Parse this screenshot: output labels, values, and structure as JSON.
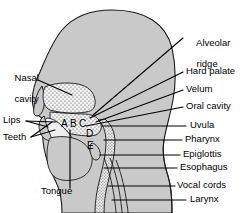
{
  "figure": {
    "background_color": "#ffffff",
    "head_fill_color": "#c9c9c9",
    "cavity_fill_color": "#f2f2f2",
    "outline_color": "#1a1a1a",
    "leader_line_color": "#000000",
    "text_color": "#000000"
  },
  "labels_left": [
    {
      "id": "nasal-cavity",
      "text_line1": "Nasal",
      "text_line2": "cavity",
      "x": 4,
      "y": 68
    },
    {
      "id": "lips",
      "text": "Lips",
      "x": 3,
      "y": 119
    },
    {
      "id": "teeth",
      "text": "Teeth",
      "x": 3,
      "y": 136
    },
    {
      "id": "tongue",
      "text": "Tongue",
      "x": 41,
      "y": 190
    }
  ],
  "labels_right": [
    {
      "id": "alveolar-ridge",
      "text_line1": "Alveolar",
      "text_line2": "ridge",
      "x": 186,
      "y": 33
    },
    {
      "id": "hard-palate",
      "text": "Hard palate",
      "x": 186,
      "y": 68
    },
    {
      "id": "velum",
      "text": "Velum",
      "x": 186,
      "y": 87
    },
    {
      "id": "oral-cavity",
      "text": "Oral cavity",
      "x": 186,
      "y": 104
    },
    {
      "id": "uvula",
      "text": "Uvula",
      "x": 190,
      "y": 123
    },
    {
      "id": "pharynx",
      "text": "Pharynx",
      "x": 185,
      "y": 137
    },
    {
      "id": "epiglottis",
      "text": "Epiglottis",
      "x": 183,
      "y": 152
    },
    {
      "id": "esophagus",
      "text": "Esophagus",
      "x": 180,
      "y": 165
    },
    {
      "id": "vocal-cords",
      "text": "Vocal cords",
      "x": 178,
      "y": 183
    },
    {
      "id": "larynx",
      "text": "Larynx",
      "x": 190,
      "y": 197
    }
  ],
  "place_markers": [
    {
      "id": "marker-a",
      "text": "A",
      "x": 61,
      "y": 124
    },
    {
      "id": "marker-b",
      "text": "B",
      "x": 70,
      "y": 124
    },
    {
      "id": "marker-c",
      "text": "C",
      "x": 79,
      "y": 124
    },
    {
      "id": "marker-d",
      "text": "D",
      "x": 85,
      "y": 133
    },
    {
      "id": "marker-e",
      "text": "E",
      "x": 86,
      "y": 145
    }
  ]
}
